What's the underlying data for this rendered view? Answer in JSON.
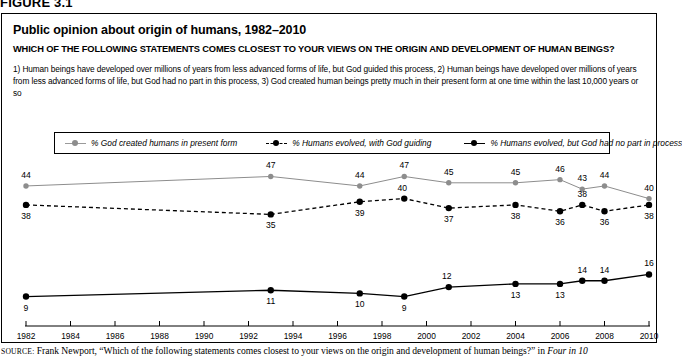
{
  "figure": {
    "number_label": "FIGURE 3.1",
    "title": "Public opinion about origin of humans, 1982–2010",
    "subtitle": "WHICH OF THE FOLLOWING STATEMENTS COMES CLOSEST TO YOUR VIEWS ON THE ORIGIN AND DEVELOPMENT OF HUMAN BEINGS?",
    "note": "1) Human beings have developed over millions of years from less advanced forms of life, but God guided this process, 2) Human beings have developed over millions of years from less advanced forms of life, but God had no part in this process, 3) God created human beings pretty much in their present form at one time within the last 10,000 years or so"
  },
  "source": {
    "label": "SOURCE:",
    "text_before_italic": " Frank Newport, “Which of the following statements comes closest to your views on the origin and development of human beings?” in ",
    "italic_text": "Four in 10"
  },
  "colors": {
    "series_gray": "#8d8d8d",
    "series_black": "#000000",
    "axis": "#000000",
    "panel_border": "#000000"
  },
  "chart_data": {
    "type": "line",
    "title": "Public opinion about origin of humans, 1982–2010",
    "xlabel": "",
    "ylabel": "",
    "xlim": [
      1982,
      2010
    ],
    "ylim": [
      0,
      55
    ],
    "grid": false,
    "legend_position": "top",
    "x": [
      1982,
      1993,
      1997,
      1999,
      2001,
      2004,
      2006,
      2007,
      2008,
      2010
    ],
    "tick_labels": [
      "1982",
      "1984",
      "1986",
      "1988",
      "1990",
      "1992",
      "1994",
      "1996",
      "1998",
      "2000",
      "2002",
      "2004",
      "2006",
      "2008",
      "2010"
    ],
    "tick_values": [
      1982,
      1984,
      1986,
      1988,
      1990,
      1992,
      1994,
      1996,
      1998,
      2000,
      2002,
      2004,
      2006,
      2008,
      2010
    ],
    "series": [
      {
        "name": "% God created humans in present form",
        "style": "solid-gray",
        "color": "#8d8d8d",
        "values": [
          44,
          47,
          44,
          47,
          45,
          45,
          46,
          43,
          44,
          40
        ],
        "label_side": "above"
      },
      {
        "name": "% Humans evolved, with God guiding",
        "style": "dashed-black",
        "color": "#000000",
        "values": [
          38,
          35,
          39,
          40,
          37,
          38,
          36,
          38,
          36,
          38
        ],
        "label_side": "mixed"
      },
      {
        "name": "% Humans evolved, but God had no part in process",
        "style": "solid-black",
        "color": "#000000",
        "values": [
          9,
          11,
          10,
          9,
          12,
          13,
          13,
          14,
          14,
          16
        ],
        "label_side": "below"
      }
    ]
  }
}
